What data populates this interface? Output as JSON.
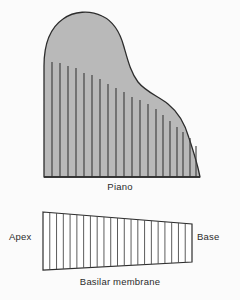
{
  "figure": {
    "background_color": "#fbfbfb"
  },
  "piano": {
    "caption": "Piano",
    "fill_color": "#b9b9b9",
    "outline_color": "#2d2d2d",
    "string_color": "#3a3a3a",
    "baseline_y": 177,
    "left_x": 44,
    "right_x": 200,
    "top_y": 12,
    "strings": [
      {
        "x": 52,
        "top": 62
      },
      {
        "x": 60,
        "top": 63
      },
      {
        "x": 68,
        "top": 66
      },
      {
        "x": 76,
        "top": 68
      },
      {
        "x": 84,
        "top": 73
      },
      {
        "x": 92,
        "top": 75
      },
      {
        "x": 100,
        "top": 79
      },
      {
        "x": 108,
        "top": 84
      },
      {
        "x": 116,
        "top": 88
      },
      {
        "x": 124,
        "top": 92
      },
      {
        "x": 132,
        "top": 97
      },
      {
        "x": 140,
        "top": 100
      },
      {
        "x": 148,
        "top": 104
      },
      {
        "x": 156,
        "top": 109
      },
      {
        "x": 163,
        "top": 115
      },
      {
        "x": 170,
        "top": 121
      },
      {
        "x": 177,
        "top": 127
      },
      {
        "x": 183,
        "top": 132
      },
      {
        "x": 190,
        "top": 138
      },
      {
        "x": 196,
        "top": 146
      }
    ]
  },
  "membrane": {
    "caption": "Basilar membrane",
    "apex_label": "Apex",
    "base_label": "Base",
    "fill_color": "#ffffff",
    "outline_color": "#2d2d2d",
    "line_color": "#4a4a4a",
    "left_x": 43,
    "right_x": 192,
    "left_top_y": 212,
    "left_bottom_y": 270,
    "right_top_y": 224,
    "right_bottom_y": 262,
    "line_count": 22
  },
  "chart_data": {
    "type": "diagram",
    "annotations": [
      "Piano",
      "Apex",
      "Base",
      "Basilar membrane"
    ],
    "series": [
      {
        "name": "Piano string lengths (relative, left to right)",
        "values": [
          115,
          114,
          111,
          109,
          104,
          102,
          98,
          93,
          89,
          85,
          80,
          77,
          73,
          68,
          62,
          56,
          50,
          45,
          39,
          31
        ]
      },
      {
        "name": "Basilar membrane width (apex to base, relative)",
        "values": [
          58,
          56,
          54,
          52,
          50,
          48,
          46,
          44,
          42,
          40,
          38
        ]
      }
    ],
    "xlabel": "Position (apex → base / low → high frequency)",
    "ylabel": "Length / width"
  }
}
